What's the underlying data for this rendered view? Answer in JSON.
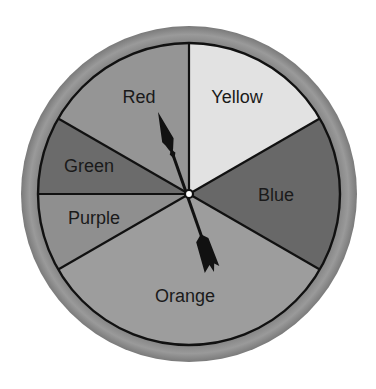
{
  "spinner": {
    "center": {
      "x": 189,
      "y": 194
    },
    "outer_radius": 168,
    "inner_radius": 151,
    "ring_color": "#8c8c8c",
    "ring_edge_color": "#7a7a7a",
    "border_color": "#111111",
    "sectors": [
      {
        "label": "Yellow",
        "start_deg": 0,
        "end_deg": 60,
        "color": "#e2e2e2",
        "label_x": 237,
        "label_y": 103
      },
      {
        "label": "Blue",
        "start_deg": 60,
        "end_deg": 120,
        "color": "#686868",
        "label_x": 276,
        "label_y": 201
      },
      {
        "label": "Orange",
        "start_deg": 120,
        "end_deg": 240,
        "color": "#9d9d9d",
        "label_x": 185,
        "label_y": 302
      },
      {
        "label": "Purple",
        "start_deg": 240,
        "end_deg": 270,
        "color": "#8f8f8f",
        "label_x": 94,
        "label_y": 224
      },
      {
        "label": "Green",
        "start_deg": 270,
        "end_deg": 300,
        "color": "#6b6b6b",
        "label_x": 89,
        "label_y": 172
      },
      {
        "label": "Red",
        "start_deg": 300,
        "end_deg": 360,
        "color": "#959595",
        "label_x": 139,
        "label_y": 103
      }
    ],
    "pointer": {
      "points_to": "Red",
      "tip": {
        "x": 158,
        "y": 112
      },
      "tail": {
        "x": 214,
        "y": 272
      },
      "color": "#111111"
    },
    "hub": {
      "radius": 4,
      "fill": "#ffffff",
      "stroke": "#111111"
    }
  }
}
